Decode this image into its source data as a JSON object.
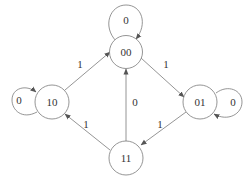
{
  "diagram": {
    "type": "state-transition",
    "nodes": [
      {
        "id": "00",
        "label": "00"
      },
      {
        "id": "10",
        "label": "10"
      },
      {
        "id": "01",
        "label": "01"
      },
      {
        "id": "11",
        "label": "11"
      }
    ],
    "edges": [
      {
        "from": "00",
        "to": "00",
        "label": "0"
      },
      {
        "from": "10",
        "to": "10",
        "label": "0"
      },
      {
        "from": "01",
        "to": "01",
        "label": "0"
      },
      {
        "from": "10",
        "to": "00",
        "label": "1"
      },
      {
        "from": "00",
        "to": "01",
        "label": "1"
      },
      {
        "from": "01",
        "to": "11",
        "label": "1"
      },
      {
        "from": "11",
        "to": "10",
        "label": "1"
      },
      {
        "from": "11",
        "to": "00",
        "label": "0"
      }
    ]
  }
}
